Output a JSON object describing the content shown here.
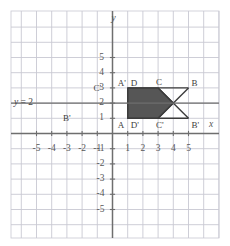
{
  "figure": {
    "kind": "coordinate-plane",
    "colors": {
      "background": "#ffffff",
      "grid": "#c8c8d2",
      "axis": "#6e6e6e",
      "reflection_line": "#6e6e6e",
      "shape_fill": "#565656",
      "shape_stroke": "#3c3c3c",
      "text": "#4a4a4a"
    }
  },
  "axes": {
    "x_label": "x",
    "y_label": "y",
    "x_ticks": [
      "-5",
      "-4",
      "-3",
      "-2",
      "-1",
      "1",
      "2",
      "3",
      "4",
      "5"
    ],
    "y_ticks_positive": [
      "5",
      "4",
      "3",
      "2",
      "1"
    ],
    "y_ticks_negative": [
      "-1",
      "-2",
      "-3",
      "-4",
      "-5"
    ],
    "xlim": [
      -5.8,
      5.8
    ],
    "ylim": [
      -5.8,
      5.8
    ],
    "grid": true
  },
  "annotations": {
    "line_equation": "y = 2",
    "line_equation_y_value": 2
  },
  "chart_data": {
    "type": "scatter",
    "title": "",
    "xlabel": "x",
    "ylabel": "y",
    "xlim": [
      -5.8,
      5.8
    ],
    "ylim": [
      -5.8,
      5.8
    ],
    "shapes": [
      {
        "name": "preimage-ABCD",
        "filled": true,
        "points": [
          {
            "label": "A",
            "x": 1,
            "y": 1
          },
          {
            "label": "B",
            "x": 5,
            "y": 3
          },
          {
            "label": "C",
            "x": 3,
            "y": 3
          },
          {
            "label": "D",
            "x": 1,
            "y": 3
          }
        ]
      },
      {
        "name": "image-A'B'C'D'",
        "filled": false,
        "points": [
          {
            "label": "A'",
            "x": 1,
            "y": 3
          },
          {
            "label": "B'",
            "x": 5,
            "y": 1
          },
          {
            "label": "C'",
            "x": 3,
            "y": 1
          },
          {
            "label": "D'",
            "x": 1,
            "y": 1
          }
        ]
      }
    ],
    "vertex_labels": [
      {
        "text": "A'",
        "x": 1,
        "y": 3,
        "anchor": "left-above"
      },
      {
        "text": "D",
        "x": 1,
        "y": 3,
        "anchor": "right-above"
      },
      {
        "text": "C",
        "x": 3,
        "y": 3,
        "anchor": "above"
      },
      {
        "text": "B",
        "x": 5,
        "y": 3,
        "anchor": "right-above"
      },
      {
        "text": "A",
        "x": 1,
        "y": 1,
        "anchor": "left-below"
      },
      {
        "text": "D'",
        "x": 1,
        "y": 1,
        "anchor": "right-below"
      },
      {
        "text": "C'",
        "x": 3,
        "y": 1,
        "anchor": "below"
      },
      {
        "text": "B'",
        "x": 5,
        "y": 1,
        "anchor": "right-below"
      }
    ],
    "stray_labels": [
      {
        "text": "C'",
        "x": -1,
        "y": 3
      },
      {
        "text": "B'",
        "x": -3,
        "y": 1
      }
    ]
  }
}
